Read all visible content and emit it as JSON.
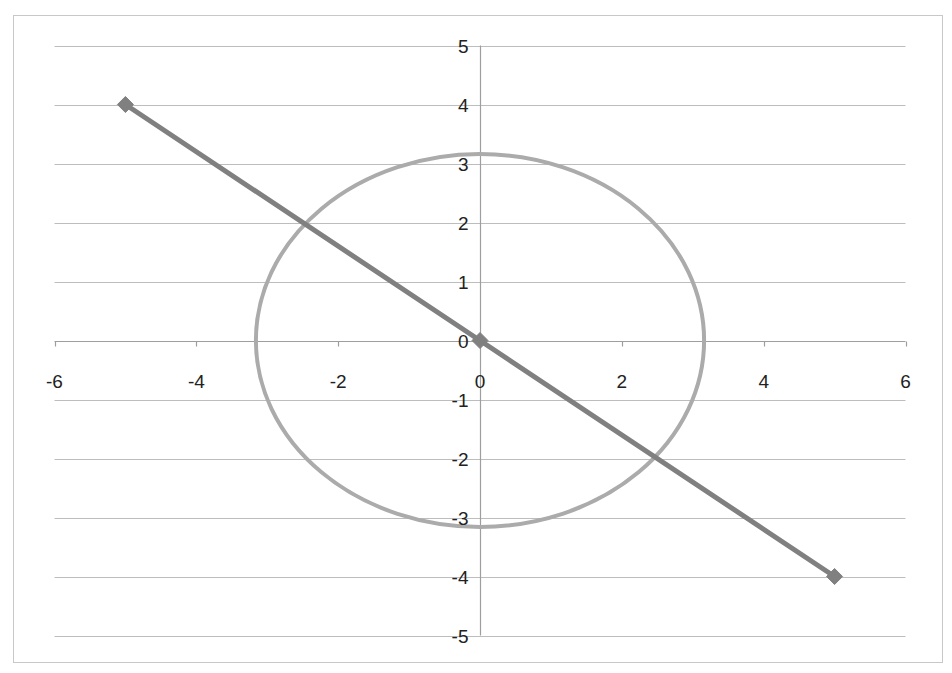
{
  "chart_data": {
    "type": "scatter",
    "title": "",
    "xlabel": "",
    "ylabel": "",
    "xlim": [
      -6,
      6
    ],
    "ylim": [
      -5,
      5
    ],
    "x_ticks": [
      -6,
      -4,
      -2,
      0,
      2,
      4,
      6
    ],
    "y_ticks": [
      5,
      4,
      3,
      2,
      1,
      0,
      -1,
      -2,
      -3,
      -4,
      -5
    ],
    "x_tick_labels": [
      "-6",
      "-4",
      "-2",
      "0",
      "2",
      "4",
      "6"
    ],
    "y_tick_labels": [
      "5",
      "4",
      "3",
      "2",
      "1",
      "0",
      "-1",
      "-2",
      "-3",
      "-4",
      "-5"
    ],
    "grid": {
      "horizontal": true,
      "vertical": false
    },
    "legend": null,
    "series": [
      {
        "name": "line",
        "kind": "line-with-markers",
        "marker": "diamond",
        "color": "#808080",
        "x": [
          -5,
          0,
          5
        ],
        "y": [
          4,
          0,
          -4
        ]
      },
      {
        "name": "circle",
        "kind": "smooth-line",
        "marker": "none",
        "color": "#ababab",
        "shape": "circle x^2 + y^2 = 10",
        "center": [
          0,
          0
        ],
        "radius": 3.16
      }
    ]
  },
  "colors": {
    "gridline": "#bdbdbd",
    "axis": "#9e9e9e",
    "border": "#c8c8c8",
    "line_series": "#808080",
    "circle_series": "#ababab",
    "text": "#222222"
  }
}
